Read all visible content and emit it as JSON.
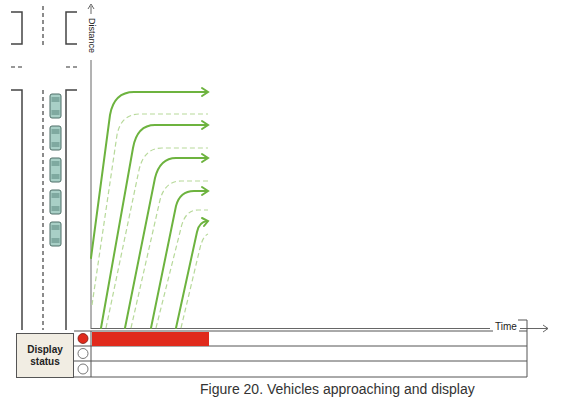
{
  "figure": {
    "caption": "Figure 20. Vehicles approaching and display",
    "axes": {
      "x_label": "Time",
      "y_label": "Distance"
    },
    "road": {
      "car_count": 5,
      "car_color": "#a8cfc6"
    },
    "trajectories": {
      "solid_color": "#6db33f",
      "dashed_color": "#b7d99a",
      "solid_count": 5,
      "dashed_count": 5
    },
    "display_status": {
      "label_line1": "Display",
      "label_line2": "status",
      "rows": [
        {
          "state": "red",
          "active": true,
          "bar_color": "#e02a1c"
        },
        {
          "state": "off",
          "active": false
        },
        {
          "state": "off",
          "active": false
        }
      ]
    }
  }
}
